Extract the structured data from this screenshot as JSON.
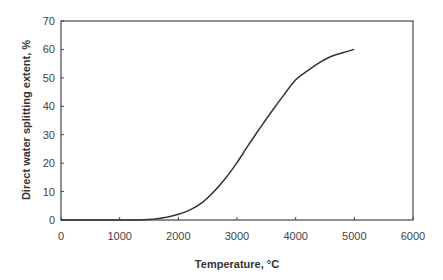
{
  "chart_data": {
    "type": "line",
    "title": "",
    "xlabel": "Temperature, °C",
    "ylabel": "Direct water splitting extent, %",
    "xlim": [
      0,
      6000
    ],
    "ylim": [
      0,
      70
    ],
    "x_ticks": [
      0,
      1000,
      2000,
      3000,
      4000,
      5000,
      6000
    ],
    "y_ticks": [
      0,
      10,
      20,
      30,
      40,
      50,
      60,
      70
    ],
    "grid": false,
    "legend": null,
    "series": [
      {
        "name": "Direct water splitting extent",
        "color": "#333333",
        "x": [
          0,
          1000,
          1400,
          1600,
          1800,
          2000,
          2200,
          2400,
          2600,
          2800,
          3000,
          3200,
          3400,
          3600,
          3800,
          4000,
          4200,
          4400,
          4600,
          4800,
          5000
        ],
        "y": [
          0,
          0,
          0.1,
          0.4,
          1.0,
          2.0,
          3.6,
          6.0,
          9.8,
          14.6,
          20.2,
          26.5,
          32.6,
          38.4,
          44.0,
          49.3,
          52.5,
          55.3,
          57.5,
          58.8,
          60.0
        ]
      }
    ]
  }
}
